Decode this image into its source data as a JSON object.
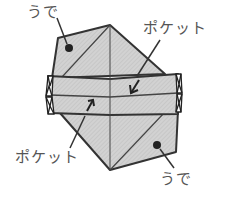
{
  "diagram": {
    "type": "origami-fold-step",
    "colors": {
      "paper": "#cfcfcf",
      "hatch": "#bdbdbd",
      "outline": "#333333",
      "text": "#555555",
      "background": "#ffffff"
    },
    "labels": {
      "arm_top": "うで",
      "pocket_top": "ポケット",
      "pocket_bottom": "ポケット",
      "arm_bottom": "うで"
    }
  }
}
